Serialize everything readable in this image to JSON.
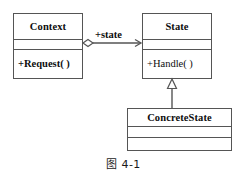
{
  "diagram": {
    "kind": "uml-class-diagram",
    "caption": "图 4-1",
    "line_color": "#555555",
    "text_color": "#0d0d0d",
    "background": "#ffffff",
    "classes": [
      {
        "id": "context",
        "name": "Context",
        "attributes": [],
        "operations": [
          "+Request( )"
        ]
      },
      {
        "id": "state",
        "name": "State",
        "attributes": [],
        "operations": [
          "+Handle( )"
        ]
      },
      {
        "id": "concretestate",
        "name": "ConcreteState",
        "attributes": [],
        "operations": []
      }
    ],
    "relationships": [
      {
        "id": "context-state",
        "type": "aggregation",
        "from": "context",
        "to": "state",
        "label": "+state",
        "source_decoration": "hollow-diamond",
        "target_decoration": "open-arrow"
      },
      {
        "id": "concretestate-state",
        "type": "generalization",
        "from": "concretestate",
        "to": "state",
        "label": "",
        "target_decoration": "hollow-triangle"
      }
    ]
  }
}
